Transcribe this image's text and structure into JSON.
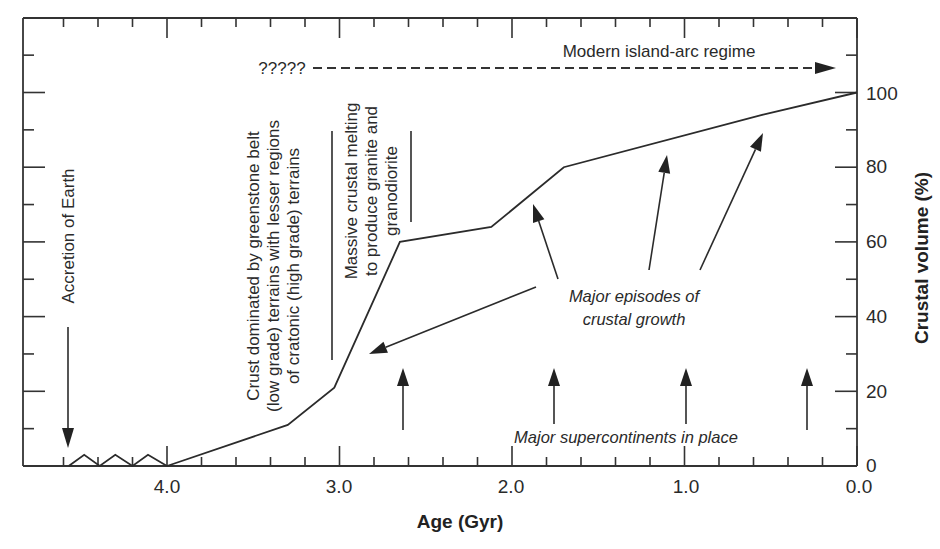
{
  "chart_data": {
    "type": "line",
    "title": "",
    "xlabel": "Age (Gyr)",
    "ylabel": "Crustal volume (%)",
    "xlim": [
      4.6,
      0.0
    ],
    "ylim": [
      0,
      110
    ],
    "x_reversed": true,
    "x_ticks": [
      "4.0",
      "3.0",
      "2.0",
      "1.0",
      "0.0"
    ],
    "y_ticks": [
      "0",
      "20",
      "40",
      "60",
      "80",
      "100"
    ],
    "y_axis_position": "right",
    "grid": false,
    "legend": null,
    "series": [
      {
        "name": "Crustal volume",
        "x": [
          4.0,
          3.3,
          3.03,
          2.65,
          2.12,
          1.7,
          0.55,
          0.0
        ],
        "y": [
          0,
          11,
          21,
          60,
          64,
          80,
          94,
          100
        ]
      }
    ],
    "early_zigzag": {
      "x": [
        4.57,
        4.48,
        4.39,
        4.3,
        4.2,
        4.11,
        4.0
      ],
      "y": [
        0,
        3,
        0,
        3,
        0,
        3,
        0
      ]
    },
    "annotations": {
      "accretion": "Accretion of Earth",
      "crust_dominated": [
        "Crust dominated by greenstone belt",
        "(low grade) terrains with lesser regions",
        "of cratonic (high grade) terrains"
      ],
      "massive_melting": [
        "Massive crustal melting",
        "to produce granite and",
        "granodiorite"
      ],
      "unknown": "?????",
      "modern_regime": "Modern island-arc regime",
      "growth_episodes": [
        "Major episodes of",
        "crustal growth"
      ],
      "supercontinents": "Major supercontinents in place",
      "supercontinent_ages": [
        2.65,
        1.77,
        1.0,
        0.3
      ],
      "growth_episode_ages": [
        3.0,
        1.9,
        1.1,
        0.55
      ]
    }
  }
}
